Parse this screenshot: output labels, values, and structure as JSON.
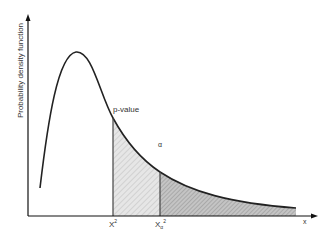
{
  "diagram": {
    "type": "chi-square distribution with p-value and alpha regions",
    "y_axis_label": "Probability density function",
    "x_axis_label": "x",
    "curve_label": "p-value",
    "alpha_label": "α",
    "x_ticks": [
      {
        "label": "X",
        "sup": "2"
      },
      {
        "label": "X",
        "sub": "α",
        "sup": "2"
      }
    ],
    "colors": {
      "curve": "#222222",
      "axis": "#111111",
      "shade_light": "#e2e2e2",
      "shade_dark": "#b8b8b8"
    }
  }
}
